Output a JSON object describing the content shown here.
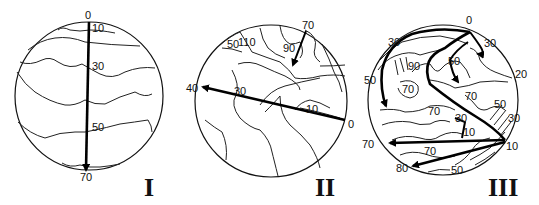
{
  "figure": {
    "panels": [
      {
        "id": "I",
        "roman_label": "I",
        "contour_labels": [
          "0",
          "10",
          "30",
          "50",
          "70"
        ],
        "arrow": {
          "from": "0",
          "to": "70",
          "direction": "top-to-bottom"
        }
      },
      {
        "id": "II",
        "roman_label": "II",
        "contour_labels": [
          "70",
          "50",
          "110",
          "90",
          "40",
          "30",
          "10",
          "0"
        ],
        "arrows": [
          {
            "from": "0",
            "to": "40",
            "direction": "right-to-left"
          },
          {
            "from": "70",
            "to": "90",
            "direction": "down-left"
          }
        ]
      },
      {
        "id": "III",
        "roman_label": "III",
        "contour_labels": [
          "0",
          "30",
          "30",
          "50",
          "90",
          "50",
          "20",
          "70",
          "70",
          "70",
          "50",
          "30",
          "30",
          "10",
          "70",
          "10",
          "70",
          "80",
          "50"
        ],
        "arrows": [
          {
            "from": "0",
            "to": "50",
            "description": "loop from top to left"
          },
          {
            "from": "0",
            "to": "30",
            "description": "hook near top right"
          },
          {
            "from": "10",
            "to": "70",
            "description": "right to left"
          },
          {
            "from": "10",
            "to": "80",
            "description": "right to lower left"
          }
        ]
      }
    ]
  },
  "labels": {
    "p1": {
      "l0": "0",
      "l10": "10",
      "l30": "30",
      "l50": "50",
      "l70": "70",
      "roman": "I"
    },
    "p2": {
      "l70": "70",
      "l50": "50",
      "l110": "110",
      "l90": "90",
      "l40": "40",
      "l30": "30",
      "l10": "10",
      "l0": "0",
      "roman": "II"
    },
    "p3": {
      "l0": "0",
      "l30a": "30",
      "l30b": "30",
      "l50a": "50",
      "l90": "90",
      "l50b": "50",
      "l20": "20",
      "l70a": "70",
      "l70b": "70",
      "l70c": "70",
      "l50c": "50",
      "l30c": "30",
      "l30d": "30",
      "l10a": "10",
      "l70d": "70",
      "l10b": "10",
      "l70e": "70",
      "l80": "80",
      "l50d": "50",
      "roman": "III"
    }
  }
}
